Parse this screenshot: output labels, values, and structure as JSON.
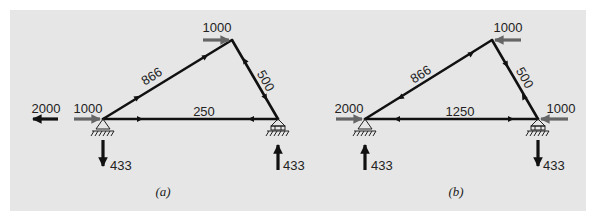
{
  "figure": {
    "background": "#e6e6e6",
    "member_color": "#111111",
    "applied_load_color": "#666666",
    "reaction_color": "#111111"
  },
  "panels": [
    {
      "caption": "(a)",
      "nodes": {
        "left": "pin support",
        "right": "roller support",
        "apex": "joint"
      },
      "members": [
        {
          "name": "left-apex",
          "force": "866",
          "label": "866"
        },
        {
          "name": "apex-right",
          "force": "500",
          "label": "500"
        },
        {
          "name": "left-right",
          "force": "250",
          "label": "250"
        }
      ],
      "applied_loads": [
        {
          "at": "apex",
          "value": "1000",
          "direction": "right"
        },
        {
          "at": "left",
          "value": "1000",
          "direction": "right"
        }
      ],
      "reactions": [
        {
          "at": "left-horizontal",
          "value": "2000",
          "direction": "left"
        },
        {
          "at": "left-vertical",
          "value": "433",
          "direction": "down"
        },
        {
          "at": "right-vertical",
          "value": "433",
          "direction": "up"
        }
      ]
    },
    {
      "caption": "(b)",
      "nodes": {
        "left": "pin support",
        "right": "roller support",
        "apex": "joint"
      },
      "members": [
        {
          "name": "left-apex",
          "force": "866",
          "label": "866"
        },
        {
          "name": "apex-right",
          "force": "500",
          "label": "500"
        },
        {
          "name": "left-right",
          "force": "1250",
          "label": "1250"
        }
      ],
      "applied_loads": [
        {
          "at": "apex",
          "value": "1000",
          "direction": "left"
        },
        {
          "at": "left",
          "value": "2000",
          "direction": "right"
        },
        {
          "at": "right",
          "value": "1000",
          "direction": "left"
        }
      ],
      "reactions": [
        {
          "at": "left-vertical",
          "value": "433",
          "direction": "up"
        },
        {
          "at": "right-vertical",
          "value": "433",
          "direction": "down"
        }
      ]
    }
  ]
}
